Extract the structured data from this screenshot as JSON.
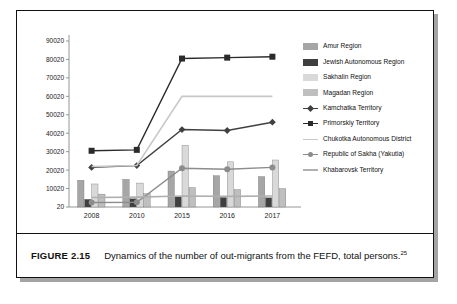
{
  "figure": {
    "number": "FIGURE 2.15",
    "caption": "Dynamics of the number of out-migrants from the FEFD, total persons.",
    "footnote_marker": "25"
  },
  "chart_data": {
    "type": "bar",
    "title": "",
    "xlabel": "",
    "ylabel": "",
    "categories": [
      "2008",
      "2010",
      "2015",
      "2016",
      "2017"
    ],
    "ylim": [
      20,
      90020
    ],
    "yticks": [
      20,
      10020,
      20020,
      30020,
      40020,
      50020,
      60020,
      70020,
      80020,
      90020
    ],
    "grid": false,
    "legend_position": "right",
    "series": [
      {
        "name": "Amur Region",
        "type": "bar",
        "color": "#a6a6a6",
        "values": [
          14500,
          15000,
          19500,
          17000,
          16500
        ]
      },
      {
        "name": "Jewish Autonomous Region",
        "type": "bar",
        "color": "#3f3f3f",
        "values": [
          4200,
          4500,
          5800,
          5200,
          5000
        ]
      },
      {
        "name": "Sakhalin Region",
        "type": "bar",
        "color": "#d9d9d9",
        "values": [
          12500,
          13000,
          33500,
          24500,
          25500
        ]
      },
      {
        "name": "Magadan Region",
        "type": "bar",
        "color": "#bfbfbf",
        "values": [
          7000,
          7200,
          10500,
          9500,
          10000
        ]
      },
      {
        "name": "Kamchatka Territory",
        "type": "line",
        "color": "#404040",
        "marker": "diamond",
        "values": [
          21500,
          22500,
          42000,
          41500,
          46000
        ]
      },
      {
        "name": "Primorskiy Territory",
        "type": "line",
        "color": "#2b2b2b",
        "marker": "square",
        "values": [
          30500,
          31000,
          80500,
          81000,
          81500
        ]
      },
      {
        "name": "Chukotka Autonomous District",
        "type": "line",
        "color": "#c8c8c8",
        "marker": "none",
        "values": [
          22000,
          22500,
          60000,
          60000,
          60000
        ]
      },
      {
        "name": "Republic of Sakha (Yakutia)",
        "type": "line",
        "color": "#8c8c8c",
        "marker": "circle",
        "values": [
          2500,
          2600,
          21000,
          20500,
          21500
        ]
      },
      {
        "name": "Khabarovsk Territory",
        "type": "line",
        "color": "#b0b0b0",
        "marker": "none",
        "values": [
          5200,
          5400,
          6000,
          5800,
          6000
        ]
      }
    ]
  }
}
